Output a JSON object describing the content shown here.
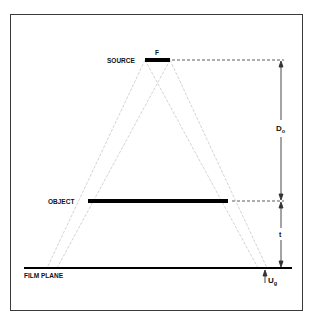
{
  "diagram": {
    "labels": {
      "source": "SOURCE",
      "focal_spot": "F",
      "object": "OBJECT",
      "film_plane": "FILM PLANE",
      "source_object_distance": "D",
      "source_object_distance_sub": "o",
      "object_film_distance": "t",
      "geometric_unsharpness": "U",
      "geometric_unsharpness_sub": "g"
    },
    "colors": {
      "bars": "#000000",
      "rays": "#c8c8c8",
      "dimension_lines": "#333333",
      "frame": "#3a3a3a"
    }
  }
}
